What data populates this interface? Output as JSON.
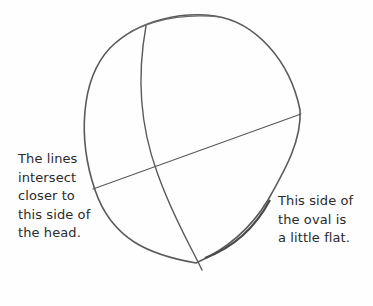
{
  "illustration": {
    "subject": "head oval construction sketch",
    "stroke_color": "#5a5a5a",
    "annotations": {
      "left": "The lines\nintersect\ncloser to\nthis side of\nthe head.",
      "right": "This side of\nthe oval is\na little flat."
    }
  }
}
